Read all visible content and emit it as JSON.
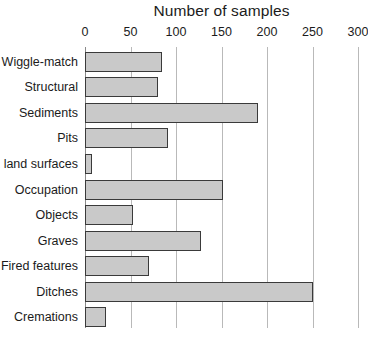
{
  "chart_data": {
    "type": "bar",
    "orientation": "horizontal",
    "title": "Number of samples",
    "xlabel": "",
    "ylabel": "",
    "xlim": [
      0,
      300
    ],
    "xticks": [
      0,
      50,
      100,
      150,
      200,
      250,
      300
    ],
    "xtick_labels": [
      "0",
      "50",
      "100",
      "150",
      "200",
      "250",
      "300"
    ],
    "grid": "vertical",
    "legend": "none",
    "categories": [
      "Wiggle-match",
      "Structural",
      "Sediments",
      "Pits",
      "Old land surfaces",
      "Occupation",
      "Objects",
      "Graves",
      "Fired features",
      "Ditches",
      "Cremations"
    ],
    "values": [
      85,
      80,
      190,
      91,
      8,
      152,
      53,
      128,
      70,
      251,
      23
    ],
    "bar_fill_color": "#c9c9c9",
    "bar_edge_color": "#3a3a3a",
    "gridline_color": "#b9b9b9",
    "background_color": "#ffffff"
  }
}
